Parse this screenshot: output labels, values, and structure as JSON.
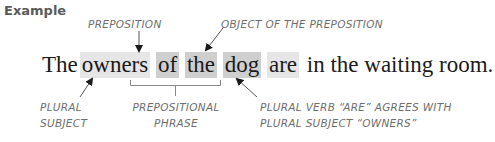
{
  "heading": "Example",
  "labels": {
    "preposition": "PREPOSITION",
    "object": "OBJECT OF THE PREPOSITION",
    "subject_line1": "PLURAL",
    "subject_line2": "SUBJECT",
    "phrase_line1": "PREPOSITIONAL",
    "phrase_line2": "PHRASE",
    "verb_line1": "PLURAL VERB “ARE” AGREES WITH",
    "verb_line2": "PLURAL SUBJECT “OWNERS”"
  },
  "sentence": {
    "words": [
      "The",
      "owners",
      "of",
      "the",
      "dog",
      "are",
      "in the waiting room."
    ]
  },
  "colors": {
    "light_highlight": "#e6e6e6",
    "dark_highlight": "#cfcfcf",
    "annotation": "#6e6e6e",
    "text": "#1a1a1a"
  }
}
